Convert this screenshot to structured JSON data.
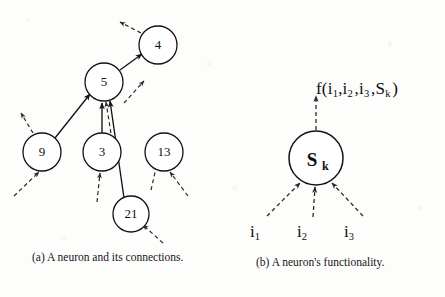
{
  "figure": {
    "background_color": "#fdfdfc",
    "ink_color": "#111111",
    "panels": [
      {
        "id": "a",
        "caption": "(a)    A neuron and its connections.",
        "nodes": [
          {
            "id": "n4",
            "label": "4",
            "cx": 158,
            "cy": 45,
            "r": 19
          },
          {
            "id": "n5",
            "label": "5",
            "cx": 104,
            "cy": 82,
            "r": 19
          },
          {
            "id": "n9",
            "label": "9",
            "cx": 42,
            "cy": 152,
            "r": 19
          },
          {
            "id": "n3",
            "label": "3",
            "cx": 102,
            "cy": 152,
            "r": 19
          },
          {
            "id": "n13",
            "label": "13",
            "cx": 164,
            "cy": 152,
            "r": 19
          },
          {
            "id": "n21",
            "label": "21",
            "cx": 131,
            "cy": 214,
            "r": 18
          }
        ],
        "solid_edges": [
          {
            "from": "n5",
            "to": "n4",
            "label": "5-to-4"
          },
          {
            "from": "n9",
            "to": "n5",
            "label": "9-to-5"
          },
          {
            "from": "n3",
            "to": "n5",
            "label": "3-to-5"
          },
          {
            "from": "n21",
            "to": "n5",
            "label": "21-to-5"
          }
        ],
        "dashed_edges": [
          {
            "label": "out-of-4-upleft"
          },
          {
            "label": "out-of-9-upleft"
          },
          {
            "label": "into-9-from-lowerleft"
          },
          {
            "label": "into-3-from-below"
          },
          {
            "label": "into-13-from-lowerright"
          },
          {
            "label": "into-21-from-lowerright"
          },
          {
            "label": "out-of-5-upright"
          },
          {
            "label": "3-to-5-dashed"
          },
          {
            "label": "21-to-13-dashed"
          }
        ]
      },
      {
        "id": "b",
        "caption": "(b) A neuron's functionality.",
        "soma": {
          "label_main": "S",
          "label_sub": "k",
          "cx": 316,
          "cy": 158,
          "r": 27
        },
        "output": {
          "formula_prefix": "f(i",
          "formula_full": "f(i1,i2 ,i3 ,Sk )",
          "arrow_label": "output-arrow"
        },
        "inputs": [
          {
            "base": "i",
            "sub": "1",
            "label": "i1"
          },
          {
            "base": "i",
            "sub": "2",
            "label": "i2"
          },
          {
            "base": "i",
            "sub": "3",
            "label": "i3"
          }
        ]
      }
    ]
  }
}
